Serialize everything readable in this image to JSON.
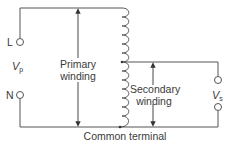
{
  "diagram": {
    "terminals": {
      "line": "L",
      "neutral": "N"
    },
    "voltages": {
      "primary_symbol": "V",
      "primary_subscript": "p",
      "secondary_symbol": "V",
      "secondary_subscript": "s"
    },
    "labels": {
      "primary_line1": "Primary",
      "primary_line2": "winding",
      "secondary_line1": "Secondary",
      "secondary_line2": "winding",
      "common": "Common terminal"
    },
    "colors": {
      "wire": "#555555",
      "text": "#3a3a3a",
      "background": "#ffffff"
    }
  }
}
